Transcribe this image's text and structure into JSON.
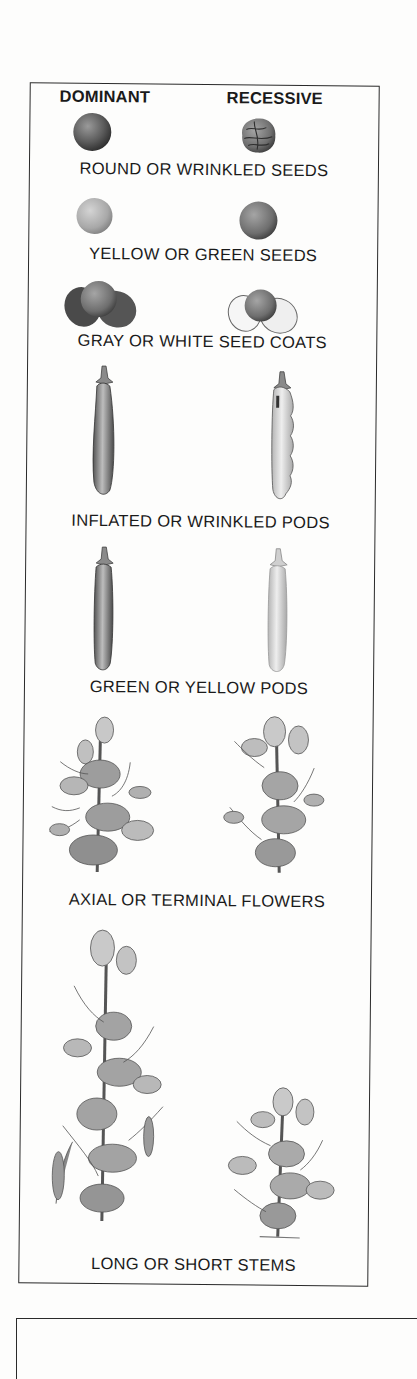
{
  "figure": {
    "headers": {
      "dominant": "DOMINANT",
      "recessive": "RECESSIVE"
    },
    "traits": [
      {
        "caption": "ROUND OR WRINKLED SEEDS",
        "dominant_icon": "round-seed-icon",
        "recessive_icon": "wrinkled-seed-icon"
      },
      {
        "caption": "YELLOW OR GREEN SEEDS",
        "dominant_icon": "yellow-seed-icon",
        "recessive_icon": "green-seed-icon"
      },
      {
        "caption": "GRAY OR WHITE SEED COATS",
        "dominant_icon": "gray-seed-coat-icon",
        "recessive_icon": "white-seed-coat-icon"
      },
      {
        "caption": "INFLATED OR WRINKLED PODS",
        "dominant_icon": "inflated-pod-icon",
        "recessive_icon": "constricted-pod-icon"
      },
      {
        "caption": "GREEN OR YELLOW PODS",
        "dominant_icon": "green-pod-icon",
        "recessive_icon": "yellow-pod-icon"
      },
      {
        "caption": "AXIAL OR TERMINAL FLOWERS",
        "dominant_icon": "axial-flower-plant-icon",
        "recessive_icon": "terminal-flower-plant-icon"
      },
      {
        "caption": "LONG OR SHORT STEMS",
        "dominant_icon": "long-stem-plant-icon",
        "recessive_icon": "short-stem-plant-icon"
      }
    ]
  }
}
